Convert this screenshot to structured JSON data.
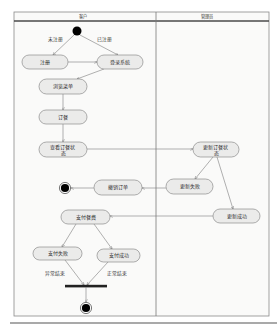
{
  "diagram": {
    "lanes": [
      {
        "title": "客户"
      },
      {
        "title": "管理员"
      }
    ],
    "actions": {
      "register": "注册",
      "login": "登录系统",
      "browse_menu": "浏览菜单",
      "order": "订餐",
      "view_status": {
        "line1": "查看订餐状",
        "line2": "态"
      },
      "update_status": {
        "line1": "更新订餐状",
        "line2": "态"
      },
      "update_failed": "更新失败",
      "update_success": "更新成功",
      "cancel_order": "撤销订单",
      "pay": "支付餐费",
      "pay_failed": "支付失败",
      "pay_success": "支付成功"
    },
    "edge_labels": {
      "unregistered": "未注册",
      "registered": "已注册",
      "abnormal_end": "异常结束",
      "normal_end": "正常结束"
    },
    "colors": {
      "action_fill": "#ebebea",
      "action_border": "#8c8c8c",
      "edge": "#7c7c7c",
      "node": "#000000",
      "frame": "#8a8a8a"
    }
  }
}
